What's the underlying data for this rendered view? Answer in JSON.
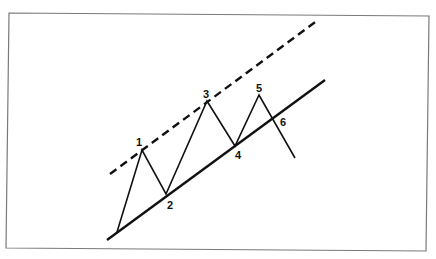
{
  "diagram": {
    "type": "trend-channel",
    "frame": {
      "x1": 8,
      "y1": 14,
      "x2": 428,
      "y2": 250,
      "color": "#777777"
    },
    "trend_line": {
      "x1": 107,
      "y1": 240,
      "x2": 325,
      "y2": 80,
      "style": "solid"
    },
    "channel_line": {
      "x1": 110,
      "y1": 174,
      "x2": 318,
      "y2": 20,
      "style": "dashed"
    },
    "price_path": [
      [
        117,
        232
      ],
      [
        142,
        150
      ],
      [
        166,
        194
      ],
      [
        207,
        101
      ],
      [
        235,
        146
      ],
      [
        259,
        95
      ],
      [
        295,
        158
      ]
    ],
    "labels": [
      {
        "text": "1",
        "x": 139,
        "y": 146
      },
      {
        "text": "2",
        "x": 170,
        "y": 209
      },
      {
        "text": "3",
        "x": 206,
        "y": 98
      },
      {
        "text": "4",
        "x": 238,
        "y": 159
      },
      {
        "text": "5",
        "x": 259,
        "y": 92
      },
      {
        "text": "6",
        "x": 283,
        "y": 126
      }
    ]
  }
}
